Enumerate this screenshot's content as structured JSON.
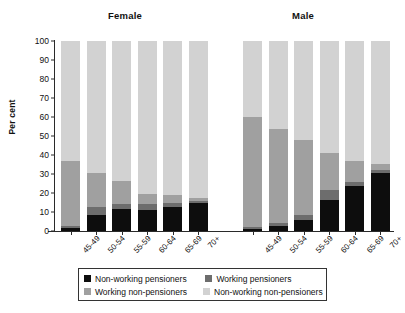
{
  "chart_data": {
    "type": "bar",
    "title": "",
    "xlabel": "",
    "ylabel": "Per cent",
    "ylim": [
      0,
      100
    ],
    "ytick_values": [
      0,
      10,
      20,
      30,
      40,
      50,
      60,
      70,
      80,
      90,
      100
    ],
    "ytick_labels": [
      "0",
      "10",
      "20",
      "30",
      "40",
      "50",
      "60",
      "70",
      "80",
      "90",
      "100"
    ],
    "grid": false,
    "stacked": true,
    "stack_order_bottom_to_top": [
      "Non-working pensioners",
      "Working pensioners",
      "Working non-pensioners",
      "Non-working non-pensioners"
    ],
    "legend_position": "bottom",
    "panels": [
      {
        "name": "Female",
        "categories": [
          "45-49",
          "50-54",
          "55-59",
          "60-64",
          "65-69",
          "70+"
        ],
        "series": [
          {
            "name": "Non-working pensioners",
            "color": "#0d0d0d",
            "values": [
              1.5,
              8.5,
              11.5,
              11.0,
              12.5,
              14.5
            ]
          },
          {
            "name": "Working pensioners",
            "color": "#6d6d6d",
            "values": [
              1.0,
              4.0,
              2.5,
              3.0,
              2.0,
              1.5
            ]
          },
          {
            "name": "Working non-pensioners",
            "color": "#a0a0a0",
            "values": [
              34.5,
              18.0,
              12.5,
              5.5,
              4.5,
              1.5
            ]
          },
          {
            "name": "Non-working non-pensioners",
            "color": "#d2d2d2",
            "values": [
              63.0,
              69.5,
              73.5,
              80.5,
              81.0,
              82.5
            ]
          }
        ]
      },
      {
        "name": "Male",
        "categories": [
          "45-49",
          "50-54",
          "55-59",
          "60-64",
          "65-69",
          "70+"
        ],
        "series": [
          {
            "name": "Non-working pensioners",
            "color": "#0d0d0d",
            "values": [
              1.0,
              2.5,
              6.0,
              16.5,
              23.5,
              30.5
            ]
          },
          {
            "name": "Working pensioners",
            "color": "#6d6d6d",
            "values": [
              1.0,
              1.5,
              2.5,
              5.0,
              2.5,
              1.5
            ]
          },
          {
            "name": "Working non-pensioners",
            "color": "#a0a0a0",
            "values": [
              58.0,
              49.5,
              39.5,
              19.5,
              11.0,
              3.5
            ]
          },
          {
            "name": "Non-working non-pensioners",
            "color": "#d2d2d2",
            "values": [
              40.0,
              46.5,
              52.0,
              59.0,
              63.0,
              64.5
            ]
          }
        ]
      }
    ],
    "legend": [
      {
        "label": "Non-working pensioners",
        "color": "#0d0d0d"
      },
      {
        "label": "Working pensioners",
        "color": "#6d6d6d"
      },
      {
        "label": "Working non-pensioners",
        "color": "#a0a0a0"
      },
      {
        "label": "Non-working non-pensioners",
        "color": "#d2d2d2"
      }
    ]
  }
}
